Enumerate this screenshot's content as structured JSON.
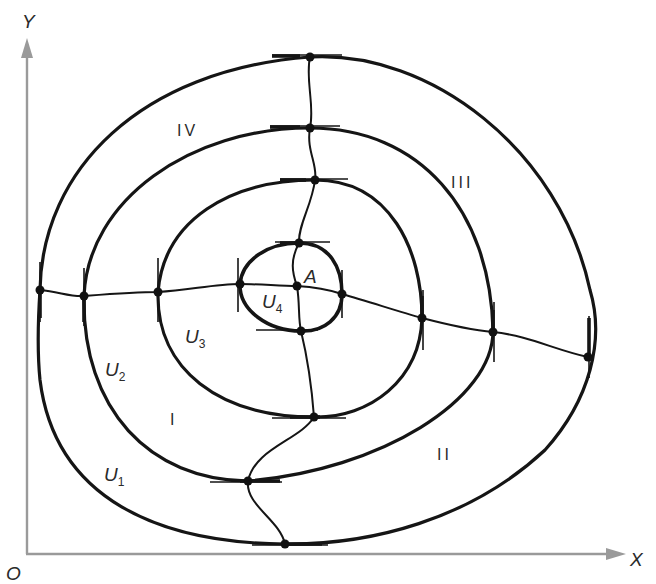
{
  "figure": {
    "axes": {
      "x_label": "X",
      "y_label": "Y",
      "origin_label": "O"
    },
    "point": {
      "label": "A"
    },
    "level_curves": [
      {
        "name": "U",
        "sub": "1"
      },
      {
        "name": "U",
        "sub": "2"
      },
      {
        "name": "U",
        "sub": "3"
      },
      {
        "name": "U",
        "sub": "4"
      }
    ],
    "regions": [
      "I",
      "II",
      "III",
      "IV"
    ],
    "colors": {
      "curve": "#151515",
      "axis": "#9a9a9a",
      "background": "#ffffff"
    }
  }
}
